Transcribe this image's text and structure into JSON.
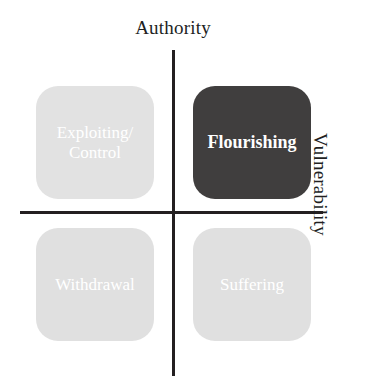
{
  "chart_data": {
    "type": "diagram",
    "subtype": "2x2-quadrant-matrix",
    "title": "",
    "axes": {
      "vertical": {
        "label": "Authority",
        "label_position": "top",
        "orientation": "vertical"
      },
      "horizontal": {
        "label": "Vulnerability",
        "label_position": "right",
        "orientation": "horizontal",
        "label_rotation_deg": 90
      }
    },
    "grid": false,
    "legend": null,
    "quadrants": [
      {
        "id": "top-left",
        "label": "Exploiting/\nControl",
        "lines": [
          "Exploiting/",
          "Control"
        ],
        "authority": "high",
        "vulnerability": "low",
        "fill": "#e2e2e2",
        "text_color": "#ffffff",
        "emphasis": false
      },
      {
        "id": "top-right",
        "label": "Flourishing",
        "lines": [
          "Flourishing"
        ],
        "authority": "high",
        "vulnerability": "high",
        "fill": "#403e3e",
        "text_color": "#ffffff",
        "emphasis": true
      },
      {
        "id": "bottom-left",
        "label": "Withdrawal",
        "lines": [
          "Withdrawal"
        ],
        "authority": "low",
        "vulnerability": "low",
        "fill": "#e0e0e0",
        "text_color": "#ffffff",
        "emphasis": false
      },
      {
        "id": "bottom-right",
        "label": "Suffering",
        "lines": [
          "Suffering"
        ],
        "authority": "low",
        "vulnerability": "high",
        "fill": "#e0e0e0",
        "text_color": "#ffffff",
        "emphasis": false
      }
    ],
    "colors": {
      "axis": "#231f20",
      "background": "#ffffff",
      "label_text": "#221f1f",
      "emphasis_fill": "#403e3e",
      "muted_fill": "#e0e0e0"
    }
  },
  "labels": {
    "axis_top": "Authority",
    "axis_right": "Vulnerability",
    "quad_top_left_line1": "Exploiting/",
    "quad_top_left_line2": "Control",
    "quad_top_right": "Flourishing",
    "quad_bottom_left": "Withdrawal",
    "quad_bottom_right": "Suffering"
  }
}
